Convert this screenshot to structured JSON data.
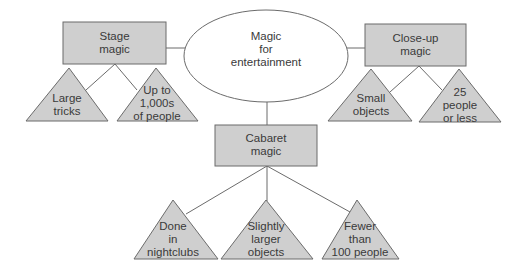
{
  "diagram": {
    "root": {
      "label": "Magic\nfor\nentertainment",
      "shape": "ellipse"
    },
    "categories": [
      {
        "id": "stage",
        "label": "Stage\nmagic",
        "shape": "rectangle",
        "children": [
          {
            "label": "Large\ntricks",
            "shape": "triangle"
          },
          {
            "label": "Up to\n1,000s\nof people",
            "shape": "triangle"
          }
        ]
      },
      {
        "id": "closeup",
        "label": "Close-up\nmagic",
        "shape": "rectangle",
        "children": [
          {
            "label": "Small\nobjects",
            "shape": "triangle"
          },
          {
            "label": "25\npeople\nor less",
            "shape": "triangle"
          }
        ]
      },
      {
        "id": "cabaret",
        "label": "Cabaret\nmagic",
        "shape": "rectangle",
        "children": [
          {
            "label": "Done\nin\nnightclubs",
            "shape": "triangle"
          },
          {
            "label": "Slightly\nlarger\nobjects",
            "shape": "triangle"
          },
          {
            "label": "Fewer\nthan\n100 people",
            "shape": "triangle"
          }
        ]
      }
    ],
    "colors": {
      "box_fill": "#cfcfcf",
      "triangle_fill": "#cfcfcf",
      "stroke": "#6b6b6b",
      "ellipse_fill": "#ffffff",
      "text": "#3a3a3a"
    }
  }
}
